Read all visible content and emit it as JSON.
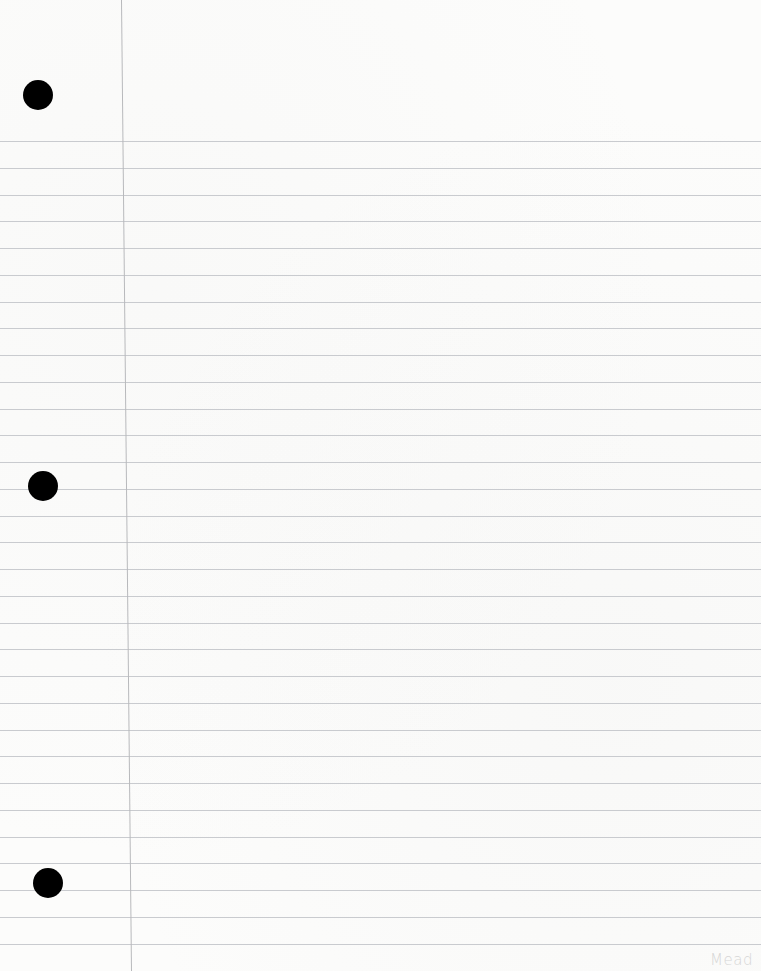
{
  "page": {
    "type": "lined-notebook-paper",
    "background_color": "#fcfcfb",
    "rule_color": "#c9cbcf",
    "margin_color": "#b8b9bc",
    "rules": {
      "first_y": 141,
      "spacing": 26.75,
      "count": 31
    },
    "holes": [
      {
        "cx": 38,
        "cy": 95
      },
      {
        "cx": 43,
        "cy": 486
      },
      {
        "cx": 48,
        "cy": 883
      }
    ],
    "brand_logo": "Mead"
  }
}
